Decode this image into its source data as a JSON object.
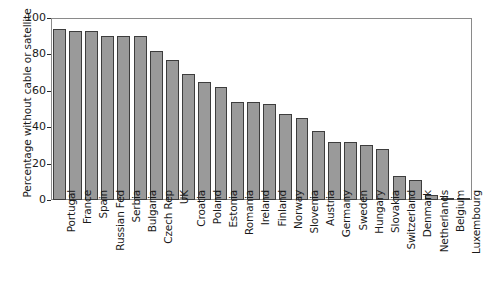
{
  "chart_data": {
    "type": "bar",
    "title": "",
    "xlabel": "",
    "ylabel": "Percentage without cable or satellite",
    "ylim": [
      0,
      100
    ],
    "yticks": [
      0,
      20,
      40,
      60,
      80,
      100
    ],
    "grid": false,
    "legend": "none",
    "bar_color": "#9a9a9a",
    "bar_edge_color": "#3d3d3d",
    "axis_color": "#8a8a8a",
    "categories": [
      "Portugal",
      "France",
      "Spain",
      "Russian Fed",
      "Serbia",
      "Bulgaria",
      "Czech Rep",
      "UK",
      "Croatia",
      "Poland",
      "Estonia",
      "Romania",
      "Ireland",
      "Finland",
      "Norway",
      "Slovenia",
      "Austria",
      "Germany",
      "Sweden",
      "Hungary",
      "Slovakia",
      "Switzerland",
      "Denmark",
      "Netherlands",
      "Belgium",
      "Luxembourg"
    ],
    "values": [
      94,
      93,
      93,
      90,
      90,
      90,
      82,
      77,
      69,
      65,
      62,
      54,
      54,
      53,
      47,
      45,
      38,
      32,
      32,
      30,
      28,
      13,
      11,
      3,
      1,
      0
    ]
  }
}
